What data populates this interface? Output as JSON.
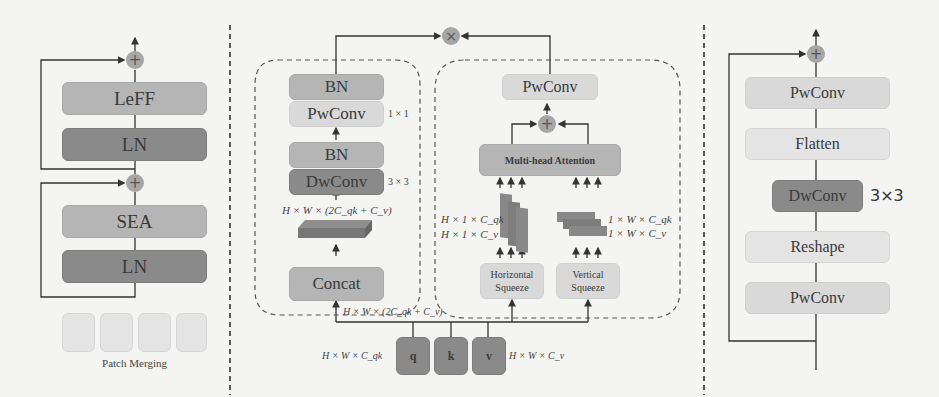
{
  "left_panel": {
    "blocks": [
      {
        "label": "LeFF",
        "shade": "medium"
      },
      {
        "label": "LN",
        "shade": "dark"
      },
      {
        "label": "SEA",
        "shade": "medium"
      },
      {
        "label": "LN",
        "shade": "dark"
      }
    ],
    "operators": [
      "+",
      "+"
    ],
    "patch_merging_label": "Patch Merging",
    "patch_count": 4
  },
  "middle_panel": {
    "multiply_op": "×",
    "conv_branch": {
      "blocks": [
        {
          "label": "BN",
          "shade": "medium"
        },
        {
          "label": "PwConv",
          "shade": "light",
          "kernel": "1 × 1"
        },
        {
          "label": "BN",
          "shade": "medium"
        },
        {
          "label": "DwConv",
          "shade": "dark",
          "kernel": "3 × 3"
        },
        {
          "label": "Concat",
          "shade": "medium"
        }
      ],
      "feature_label": "H × W × (2C_qk + C_v)"
    },
    "attention_branch": {
      "pwconv_label": "PwConv",
      "add_op": "+",
      "attention_label": "Multi-head Attention",
      "horizontal_squeeze": "Horizontal Squeeze",
      "vertical_squeeze": "Vertical Squeeze",
      "h_dims": [
        "H × 1 × C_qk",
        "H × 1 × C_v"
      ],
      "v_dims": [
        "1 × W × C_qk",
        "1 × W × C_v"
      ]
    },
    "input_label": "H × W × (2C_qk + C_v)",
    "qkv": [
      {
        "label": "q"
      },
      {
        "label": "k"
      },
      {
        "label": "v"
      }
    ],
    "q_dim": "H × W × C_qk",
    "v_dim": "H × W × C_v"
  },
  "right_panel": {
    "add_op": "+",
    "blocks": [
      {
        "label": "PwConv",
        "shade": "light"
      },
      {
        "label": "Flatten",
        "shade": "extra-light"
      },
      {
        "label": "DwConv",
        "shade": "dark",
        "kernel": "3×3"
      },
      {
        "label": "Reshape",
        "shade": "extra-light"
      },
      {
        "label": "PwConv",
        "shade": "light"
      }
    ]
  },
  "colors": {
    "background": "#f4f4f2",
    "dark_block": "#8a8a8a",
    "medium_block": "#b5b5b5",
    "light_block": "#d9d9d9",
    "line": "#333333"
  }
}
